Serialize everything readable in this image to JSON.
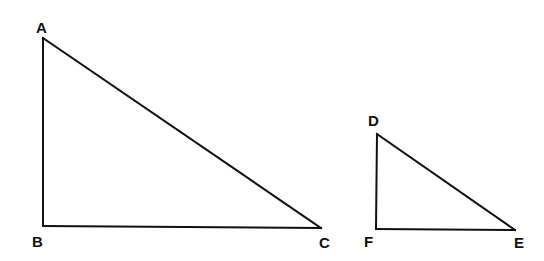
{
  "diagram": {
    "type": "geometry",
    "triangles": [
      {
        "name": "ABC",
        "right_angle_at": "B",
        "vertices": {
          "A": {
            "label": "A",
            "x": 43,
            "y": 38
          },
          "B": {
            "label": "B",
            "x": 43,
            "y": 226
          },
          "C": {
            "label": "C",
            "x": 321,
            "y": 228
          }
        },
        "edges": [
          [
            "A",
            "B"
          ],
          [
            "B",
            "C"
          ],
          [
            "A",
            "C"
          ]
        ]
      },
      {
        "name": "DEF",
        "right_angle_at": "F",
        "vertices": {
          "D": {
            "label": "D",
            "x": 377,
            "y": 134
          },
          "F": {
            "label": "F",
            "x": 376,
            "y": 229
          },
          "E": {
            "label": "E",
            "x": 515,
            "y": 230
          }
        },
        "edges": [
          [
            "D",
            "F"
          ],
          [
            "F",
            "E"
          ],
          [
            "D",
            "E"
          ]
        ]
      }
    ],
    "labels": {
      "A": "A",
      "B": "B",
      "C": "C",
      "D": "D",
      "E": "E",
      "F": "F"
    },
    "colors": {
      "stroke": "#111111",
      "background": "#ffffff"
    }
  }
}
